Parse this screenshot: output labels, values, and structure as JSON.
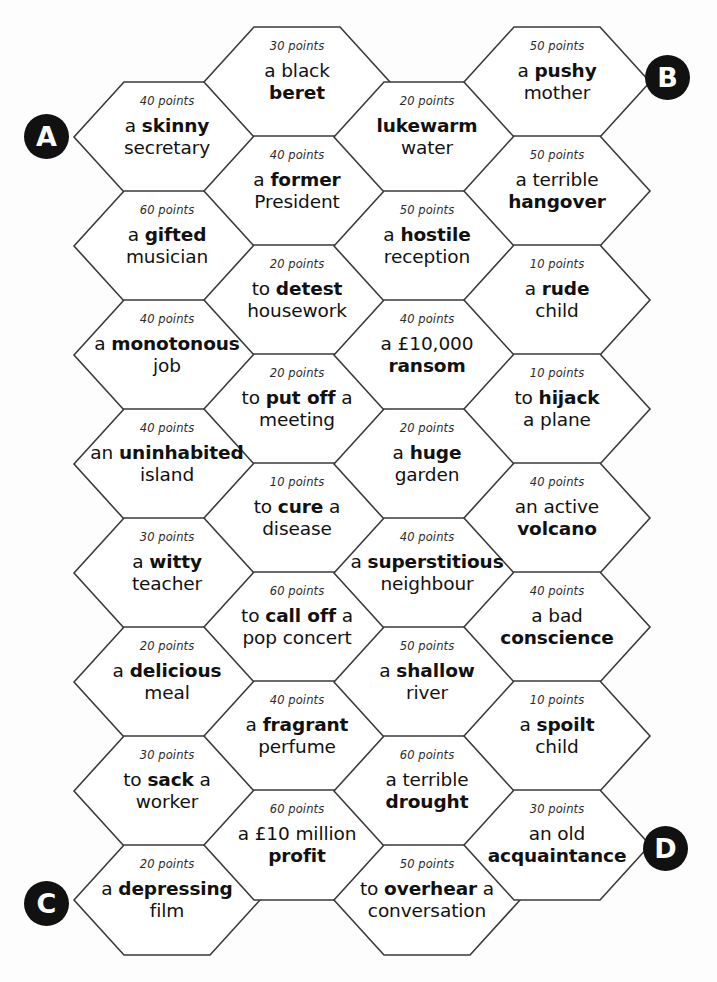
{
  "board": {
    "title": "Hexagon points board",
    "points_suffix": "points",
    "geometry": {
      "hex_width": 186,
      "hex_height": 110,
      "hex_slant": 50,
      "col_step_x": 130,
      "row_step_y": 109
    },
    "badges": [
      {
        "label": "A",
        "x": 24,
        "y": 114
      },
      {
        "label": "B",
        "x": 645,
        "y": 55
      },
      {
        "label": "C",
        "x": 24,
        "y": 881
      },
      {
        "label": "D",
        "x": 643,
        "y": 826
      }
    ],
    "columns": [
      {
        "name": "column-1",
        "x": 74,
        "y_start": 82,
        "cells": [
          {
            "points": "40 points",
            "html": "a <b>skinny</b><br>secretary"
          },
          {
            "points": "60 points",
            "html": "a <b>gifted</b><br>musician"
          },
          {
            "points": "40 points",
            "html": "a <b>monotonous</b><br>job"
          },
          {
            "points": "40 points",
            "html": "an <b>uninhabited</b><br>island"
          },
          {
            "points": "30 points",
            "html": "a <b>witty</b><br>teacher"
          },
          {
            "points": "20 points",
            "html": "a <b>delicious</b><br>meal"
          },
          {
            "points": "30 points",
            "html": "to <b>sack</b> a<br>worker"
          },
          {
            "points": "20 points",
            "html": "a <b>depressing</b><br>film"
          }
        ]
      },
      {
        "name": "column-2",
        "x": 204,
        "y_start": 27,
        "cells": [
          {
            "points": "30 points",
            "html": "a black<br><b>beret</b>"
          },
          {
            "points": "40 points",
            "html": "a <b>former</b><br>President"
          },
          {
            "points": "20 points",
            "html": "to <b>detest</b><br>housework"
          },
          {
            "points": "20 points",
            "html": "to <b>put off</b> a<br>meeting"
          },
          {
            "points": "10 points",
            "html": "to <b>cure</b> a<br>disease"
          },
          {
            "points": "60 points",
            "html": "to <b>call off</b> a<br>pop concert"
          },
          {
            "points": "40 points",
            "html": "a <b>fragrant</b><br>perfume"
          },
          {
            "points": "60 points",
            "html": "a £10 million<br><b>profit</b>"
          }
        ]
      },
      {
        "name": "column-3",
        "x": 334,
        "y_start": 82,
        "cells": [
          {
            "points": "20 points",
            "html": "<b>lukewarm</b><br>water"
          },
          {
            "points": "50 points",
            "html": "a <b>hostile</b><br>reception"
          },
          {
            "points": "40 points",
            "html": "a £10,000<br><b>ransom</b>"
          },
          {
            "points": "20 points",
            "html": "a <b>huge</b><br>garden"
          },
          {
            "points": "40 points",
            "html": "a <b>superstitious</b><br>neighbour"
          },
          {
            "points": "50 points",
            "html": "a <b>shallow</b><br>river"
          },
          {
            "points": "60 points",
            "html": "a terrible<br><b>drought</b>"
          },
          {
            "points": "50 points",
            "html": "to <b>overhear</b> a<br>conversation"
          }
        ]
      },
      {
        "name": "column-4",
        "x": 464,
        "y_start": 27,
        "cells": [
          {
            "points": "50 points",
            "html": "a <b>pushy</b><br>mother"
          },
          {
            "points": "50 points",
            "html": "a terrible<br><b>hangover</b>"
          },
          {
            "points": "10 points",
            "html": "a <b>rude</b><br>child"
          },
          {
            "points": "10 points",
            "html": "to <b>hijack</b><br>a plane"
          },
          {
            "points": "40 points",
            "html": "an active<br><b>volcano</b>"
          },
          {
            "points": "40 points",
            "html": "a bad<br><b>conscience</b>"
          },
          {
            "points": "10 points",
            "html": "a <b>spoilt</b><br>child"
          },
          {
            "points": "30 points",
            "html": "an old<br><b>acquaintance</b>"
          }
        ]
      }
    ]
  },
  "colors": {
    "badge_bg": "#111111",
    "badge_text": "#ffffff",
    "hex_stroke": "#3a3a3a",
    "page_bg": "#ffffff",
    "text": "#111111"
  }
}
